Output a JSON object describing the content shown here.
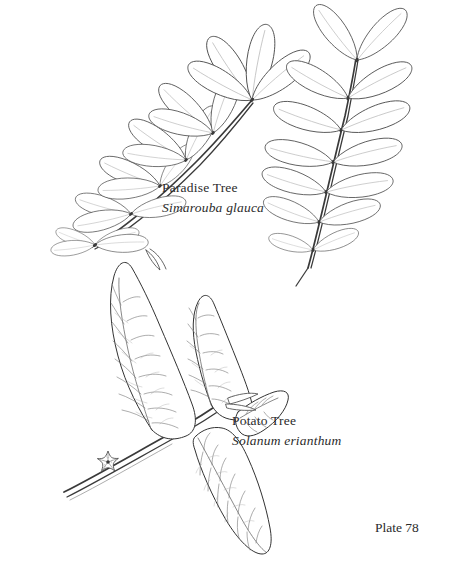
{
  "plate": {
    "background_color": "#ffffff",
    "ink_color": "#3a3a3a",
    "text_color": "#2b2b2b",
    "width": 466,
    "height": 581
  },
  "running_header": {
    "text": ""
  },
  "specimens": [
    {
      "id": "paradise-tree",
      "common_name": "Paradise Tree",
      "scientific_name": "Simarouba glauca",
      "description": "pinnately compound leaf, oblong-obovate leaflets"
    },
    {
      "id": "potato-tree",
      "common_name": "Potato Tree",
      "scientific_name": "Solanum erianthum",
      "description": "ovate-lanceolate leaves with pinnate venation and star-shaped flower"
    }
  ],
  "labels": {
    "paradise_common": "Paradise Tree",
    "paradise_latin": "Simarouba glauca",
    "potato_common": "Potato Tree",
    "potato_latin": "Solanum erianthum"
  },
  "plate_number": {
    "text": "Plate 78"
  }
}
